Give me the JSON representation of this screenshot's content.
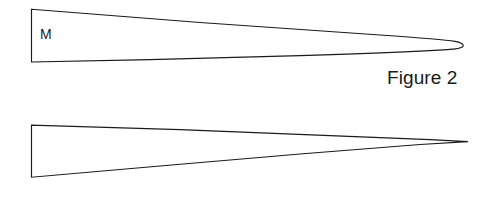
{
  "page": {
    "background_color": "#ffffff",
    "ink_color": "#1a1a1a",
    "width": 482,
    "height": 197
  },
  "figures": [
    {
      "id": "figure-2",
      "caption": "Figure 2",
      "shape_label": "M",
      "shape_name": "elongated-wedge-blunt-tip",
      "tip_style": "rounded",
      "description": "Long tapering wedge with a rounded blunt right tip"
    },
    {
      "id": "figure-3",
      "caption": "Figure 3",
      "shape_label": "N",
      "shape_name": "elongated-wedge-sharp-tip",
      "tip_style": "pointed",
      "description": "Long tapering wedge converging to a sharp right point"
    }
  ]
}
